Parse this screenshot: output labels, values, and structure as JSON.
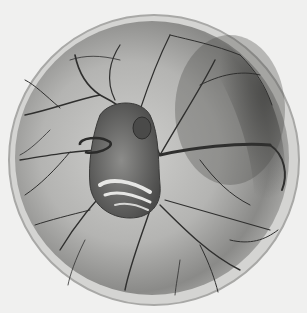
{
  "image": {
    "subject": "embryo inside egg with branching blood vessels",
    "style": "grayscale illustration",
    "colors": {
      "background": "#f0f0ef",
      "rim": "#c9c9c7",
      "sac_light": "#bdbdbb",
      "sac_dark": "#5e5e5c",
      "vessel": "#2f2f2e",
      "embryo": "#6e6e6c",
      "embryo_highlight": "#e6e6e4"
    }
  }
}
